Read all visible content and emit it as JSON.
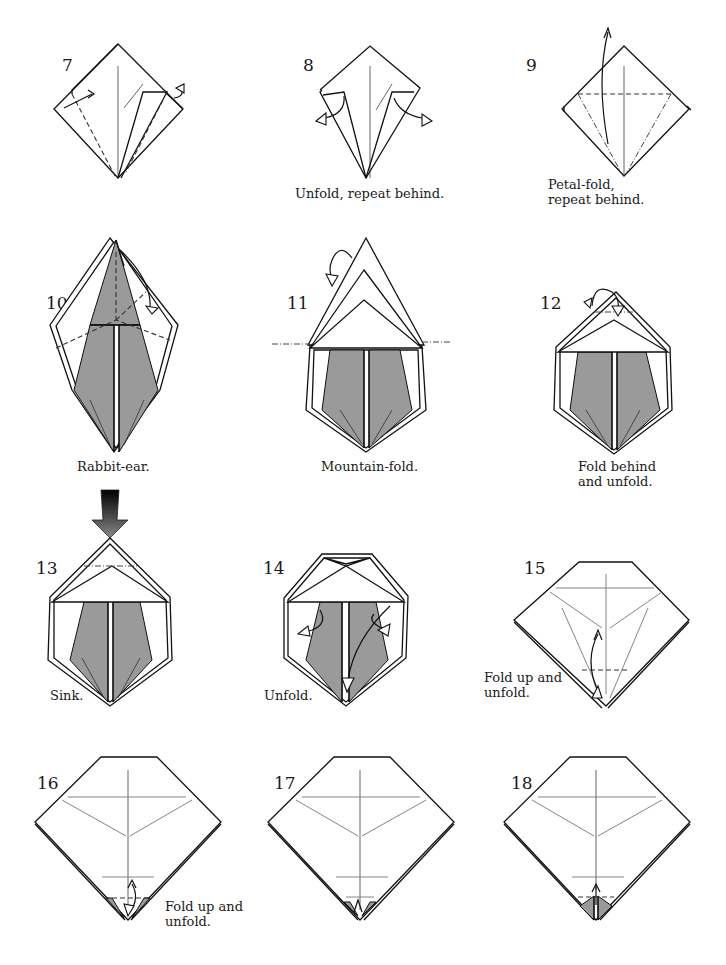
{
  "colors": {
    "paper": "#ffffff",
    "line": "#111111",
    "shaded_side": "#9a9a9a",
    "crease": "#777777"
  },
  "steps": [
    {
      "number": "7",
      "caption": ""
    },
    {
      "number": "8",
      "caption": "Unfold, repeat behind."
    },
    {
      "number": "9",
      "caption": "Petal-fold,\nrepeat behind.",
      "caption_lines": [
        "Petal-fold,",
        "repeat behind."
      ]
    },
    {
      "number": "10",
      "caption": "Rabbit-ear."
    },
    {
      "number": "11",
      "caption": "Mountain-fold."
    },
    {
      "number": "12",
      "caption": "Fold behind\nand unfold.",
      "caption_lines": [
        "Fold behind",
        "and unfold."
      ]
    },
    {
      "number": "13",
      "caption": "Sink."
    },
    {
      "number": "14",
      "caption": "Unfold."
    },
    {
      "number": "15",
      "caption": "Fold up and\nunfold.",
      "caption_lines": [
        "Fold up and",
        "unfold."
      ]
    },
    {
      "number": "16",
      "caption": "Fold up and\nunfold.",
      "caption_lines": [
        "Fold up and",
        "unfold."
      ]
    },
    {
      "number": "17",
      "caption": ""
    },
    {
      "number": "18",
      "caption": ""
    }
  ],
  "symbols": {
    "valley_fold": "dashed-line",
    "mountain_fold": "dash-dot-line",
    "sink": "solid-push-arrow",
    "fold_unfold": "double-headed-arrow"
  }
}
